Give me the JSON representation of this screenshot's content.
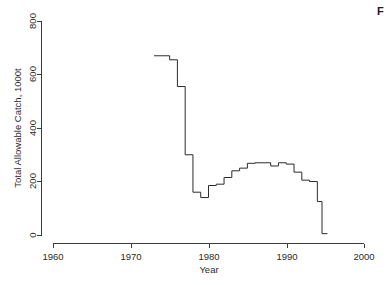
{
  "figure": {
    "caption_fragment": "F"
  },
  "chart_data": {
    "type": "line",
    "subtype": "step-post",
    "title": "",
    "xlabel": "Year",
    "ylabel": "Total Allowable Catch, 1000t",
    "xlim": [
      1960,
      2000
    ],
    "ylim": [
      0,
      800
    ],
    "xticks": [
      1960,
      1970,
      1980,
      1990,
      2000
    ],
    "xticklabels": [
      "1960",
      "1970",
      "1980",
      "1990",
      "2000"
    ],
    "yticks": [
      0,
      200,
      400,
      600,
      800
    ],
    "yticklabels": [
      "0",
      "200",
      "400",
      "600",
      "800"
    ],
    "grid": false,
    "legend": false,
    "legend_position": "none",
    "line_color": "#2b2b2b",
    "axis_color": "#3c3c3c",
    "background_color": "#ffffff",
    "series": [
      {
        "name": "Total Allowable Catch",
        "x": [
          1973,
          1974,
          1975,
          1976,
          1977,
          1978,
          1979,
          1980,
          1981,
          1982,
          1983,
          1984,
          1985,
          1986,
          1987,
          1988,
          1989,
          1990,
          1991,
          1992,
          1993,
          1994
        ],
        "values": [
          670,
          670,
          655,
          555,
          300,
          160,
          140,
          185,
          190,
          215,
          240,
          250,
          268,
          270,
          270,
          258,
          270,
          265,
          235,
          205,
          200,
          125
        ]
      }
    ],
    "annotations": []
  }
}
